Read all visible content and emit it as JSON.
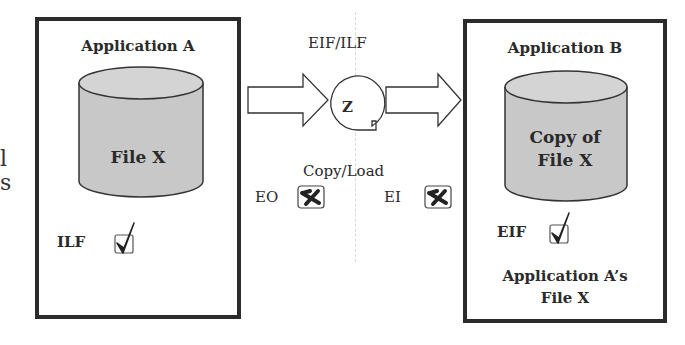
{
  "clipped_left_text": [
    "l",
    "s"
  ],
  "application_a": {
    "title": "Application A",
    "file_label": "File X",
    "type_label": "ILF",
    "type_status": "checked"
  },
  "process": {
    "top_label": "EIF/ILF",
    "symbol_label": "Z",
    "bottom_label": "Copy/Load",
    "left_type_label": "EO",
    "left_type_status": "rejected",
    "right_type_label": "EI",
    "right_type_status": "rejected"
  },
  "application_b": {
    "title": "Application B",
    "file_label_line1": "Copy of",
    "file_label_line2": "File X",
    "type_label": "EIF",
    "type_status": "checked",
    "caption_line1": "Application A’s",
    "caption_line2": "File X"
  },
  "colors": {
    "border": "#2b2b2b",
    "cylinder_fill": "#c8c8c8",
    "cylinder_top": "#d4d4d4",
    "background": "#ffffff"
  }
}
